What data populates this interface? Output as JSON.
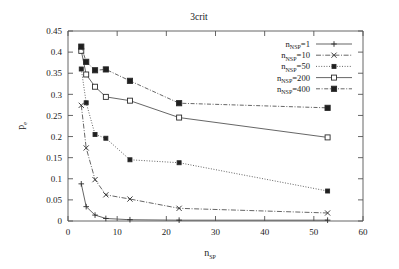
{
  "chart_data": {
    "type": "line",
    "title": "3crit",
    "xlabel": "n_SP",
    "ylabel": "p_e",
    "xlabel_base": "n",
    "xlabel_sub": "SP",
    "ylabel_base": "p",
    "ylabel_sub": "e",
    "xlim": [
      0,
      60
    ],
    "ylim": [
      0,
      0.45
    ],
    "xticks": [
      0,
      10,
      20,
      30,
      40,
      50,
      60
    ],
    "xticklabels": [
      "0",
      "10",
      "20",
      "30",
      "40",
      "50",
      "60"
    ],
    "yticks": [
      0,
      0.05,
      0.1,
      0.15,
      0.2,
      0.25,
      0.3,
      0.35,
      0.4,
      0.45
    ],
    "yticklabels": [
      "0",
      "0.05",
      "0.1",
      "0.15",
      "0.2",
      "0.25",
      "0.3",
      "0.35",
      "0.4",
      "0.45"
    ],
    "grid": false,
    "legend_position": "top-right",
    "series": [
      {
        "name": "n_NSP=1",
        "label_base": "n",
        "label_sub": "NSP",
        "label_value": "=1",
        "marker": "plus",
        "dash": "none",
        "x": [
          2.7,
          3.7,
          5.5,
          7.7,
          12.6,
          22.6,
          52.8
        ],
        "values": [
          0.088,
          0.034,
          0.014,
          0.006,
          0.003,
          0.002,
          0.002
        ]
      },
      {
        "name": "n_NSP=10",
        "label_base": "n",
        "label_sub": "NSP",
        "label_value": "=10",
        "marker": "cross",
        "dash": "dashdot",
        "x": [
          2.7,
          3.7,
          5.5,
          7.7,
          12.6,
          22.6,
          52.8
        ],
        "values": [
          0.274,
          0.173,
          0.098,
          0.062,
          0.052,
          0.03,
          0.019
        ]
      },
      {
        "name": "n_NSP=50",
        "label_base": "n",
        "label_sub": "NSP",
        "label_value": "=50",
        "marker": "filled-square-small",
        "dash": "dotted",
        "x": [
          2.7,
          3.7,
          5.5,
          7.7,
          12.6,
          22.6,
          52.8
        ],
        "values": [
          0.36,
          0.28,
          0.205,
          0.196,
          0.145,
          0.138,
          0.071
        ]
      },
      {
        "name": "n_NSP=200",
        "label_base": "n",
        "label_sub": "NSP",
        "label_value": "=200",
        "marker": "open-square",
        "dash": "solid",
        "x": [
          2.7,
          3.7,
          5.5,
          7.7,
          12.6,
          22.6,
          52.8
        ],
        "values": [
          0.403,
          0.347,
          0.318,
          0.294,
          0.285,
          0.245,
          0.198
        ]
      },
      {
        "name": "n_NSP=400",
        "label_base": "n",
        "label_sub": "NSP",
        "label_value": "=400",
        "marker": "filled-square",
        "dash": "dashdot2",
        "x": [
          2.7,
          3.7,
          5.5,
          7.7,
          12.6,
          22.6,
          52.8
        ],
        "values": [
          0.413,
          0.377,
          0.357,
          0.359,
          0.332,
          0.279,
          0.268
        ]
      }
    ],
    "colors": {
      "axis": "#555555",
      "text": "#222222",
      "line": "#4a4a4a",
      "marker": "#2b2b2b",
      "background": "#ffffff"
    }
  }
}
